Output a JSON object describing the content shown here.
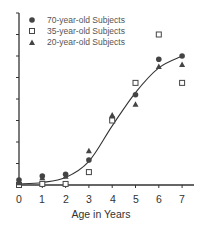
{
  "chart_data": {
    "type": "scatter",
    "title": "",
    "xlabel": "Age in Years",
    "ylabel": "",
    "x": [
      0,
      1,
      2,
      3,
      4,
      5,
      6,
      7
    ],
    "xlim": [
      0,
      7.5
    ],
    "ylim": [
      0,
      8
    ],
    "y_ticks_labeled": false,
    "y_tick_count": 8,
    "grid": false,
    "legend_position": "upper-left",
    "series": [
      {
        "name": "70-year-old Subjects",
        "marker": "filled-circle",
        "values": [
          0.23,
          0.42,
          0.5,
          1.16,
          3.1,
          4.2,
          5.85,
          6.0
        ]
      },
      {
        "name": "35-year-old Subjects",
        "marker": "open-square",
        "values": [
          0.0,
          0.05,
          0.05,
          0.6,
          3.0,
          4.75,
          7.0,
          4.75
        ]
      },
      {
        "name": "20-year-old Subjects",
        "marker": "filled-triangle",
        "values": [
          0.1,
          0.33,
          0.4,
          1.58,
          3.25,
          3.75,
          5.5,
          5.6
        ]
      }
    ],
    "fit_curve": {
      "type": "sigmoid",
      "points": [
        [
          0,
          0.05
        ],
        [
          1,
          0.12
        ],
        [
          2,
          0.35
        ],
        [
          3,
          1.1
        ],
        [
          4,
          2.75
        ],
        [
          5,
          4.3
        ],
        [
          6,
          5.45
        ],
        [
          7,
          6.0
        ]
      ]
    }
  },
  "legend": {
    "items": [
      {
        "label": "70-year-old Subjects"
      },
      {
        "label": "35-year-old Subjects"
      },
      {
        "label": "20-year-old Subjects"
      }
    ]
  },
  "x_axis": {
    "title": "Age in Years",
    "tick_labels": [
      "0",
      "1",
      "2",
      "3",
      "4",
      "5",
      "6",
      "7"
    ]
  },
  "colors": {
    "ink": "#333333",
    "legend_text": "#555555"
  }
}
